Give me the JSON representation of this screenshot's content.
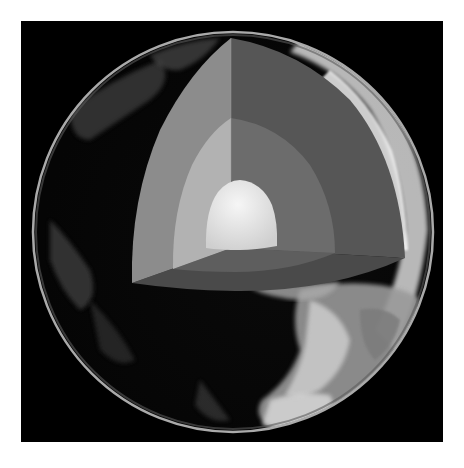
{
  "image": {
    "subject": "Earth cutaway showing internal layers",
    "width": 464,
    "height": 468,
    "background": "#ffffff",
    "frame": {
      "x": 21,
      "y": 21,
      "width": 422,
      "height": 421,
      "color": "#000000"
    },
    "globe": {
      "cx": 233,
      "cy": 232,
      "r": 200,
      "rim_color": "#bdbdbd"
    },
    "layers": [
      {
        "name": "mantle",
        "left_face_color": "#8c8c8c",
        "right_face_color": "#565656",
        "bottom_face_color": "#4a4a4a"
      },
      {
        "name": "outer-core",
        "left_face_color": "#b2b2b2",
        "right_face_color": "#6c6c6c",
        "bottom_face_color": "#5e5e5e"
      },
      {
        "name": "inner-core",
        "color": "#e6e6e6"
      }
    ],
    "cutaway": {
      "apex": [
        231,
        38
      ],
      "left_corner": [
        132,
        283
      ],
      "right_corner": [
        405,
        258
      ],
      "center": [
        231,
        248
      ]
    }
  }
}
